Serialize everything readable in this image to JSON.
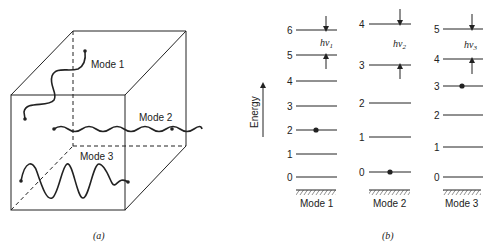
{
  "panel_a": {
    "caption": "(a)",
    "modes": [
      {
        "label": "Mode 1"
      },
      {
        "label": "Mode 2"
      },
      {
        "label": "Mode 3"
      }
    ]
  },
  "panel_b": {
    "caption": "(b)",
    "axis_label": "Energy",
    "columns": [
      {
        "label": "Mode 1",
        "levels": [
          "0",
          "1",
          "2",
          "3",
          "4",
          "5",
          "6"
        ],
        "occupied": "2",
        "quantum": "hν1",
        "quantum_base": "hν",
        "quantum_sub": "1"
      },
      {
        "label": "Mode 2",
        "levels": [
          "0",
          "1",
          "2",
          "3",
          "4"
        ],
        "occupied": "0",
        "quantum": "hν2",
        "quantum_base": "hν",
        "quantum_sub": "2"
      },
      {
        "label": "Mode 3",
        "levels": [
          "0",
          "1",
          "2",
          "3",
          "4",
          "5"
        ],
        "occupied": "3",
        "quantum": "hν3",
        "quantum_base": "hν",
        "quantum_sub": "3"
      }
    ]
  }
}
